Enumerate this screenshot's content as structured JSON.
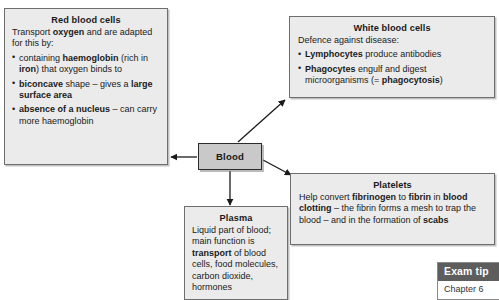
{
  "diagram": {
    "center": {
      "label": "Blood",
      "fill_color": "#c9c9c9",
      "border_color": "#2b2b2b"
    },
    "boxes": {
      "red_blood_cells": {
        "title": "Red blood cells",
        "intro": "Transport oxygen and are adapted for this by:",
        "intro_parts": [
          {
            "text": "Transport ",
            "bold": false
          },
          {
            "text": "oxygen",
            "bold": true
          },
          {
            "text": " and are adapted for this by:",
            "bold": false
          }
        ],
        "bullets": [
          "containing haemoglobin (rich in iron) that oxygen binds to",
          "biconcave shape – gives a large surface area",
          "absence of a nucleus – can carry more haemoglobin"
        ]
      },
      "white_blood_cells": {
        "title": "White blood cells",
        "intro": "Defence against disease:",
        "bullets": [
          "Lymphocytes produce antibodies",
          "Phagocytes engulf and digest microorganisms (= phagocytosis)"
        ]
      },
      "platelets": {
        "title": "Platelets",
        "body": "Help convert fibrinogen to fibrin in blood clotting – the fibrin forms a mesh to trap the blood – and in the formation of scabs"
      },
      "plasma": {
        "title": "Plasma",
        "body": "Liquid part of blood; main function is transport of blood cells, food molecules, carbon dioxide, hormones"
      }
    },
    "arrows": [
      {
        "name": "blood-to-red-blood-cells",
        "direction": "left"
      },
      {
        "name": "blood-to-white-blood-cells",
        "direction": "up-right"
      },
      {
        "name": "blood-to-platelets",
        "direction": "down-right"
      },
      {
        "name": "blood-to-plasma",
        "direction": "down"
      }
    ]
  },
  "exam_tip": {
    "header": "Exam tip",
    "body": "Chapter 6"
  },
  "colors": {
    "box_fill": "#ebebeb",
    "box_border": "#6e6e6e",
    "page_background": "#ffffff",
    "exam_tip_header_bg": "#5d5d5d",
    "arrow_color": "#1a1a1a"
  }
}
